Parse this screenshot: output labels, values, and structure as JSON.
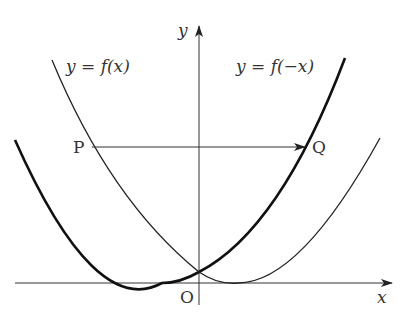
{
  "labels": {
    "y_axis": "y",
    "x_axis": "x",
    "origin": "O",
    "curve_f": "y = f(x)",
    "curve_fneg": "y = f(−x)",
    "point_p": "P",
    "point_q": "Q"
  },
  "colors": {
    "stroke": "#222222",
    "text": "#333333",
    "background": "#ffffff"
  }
}
